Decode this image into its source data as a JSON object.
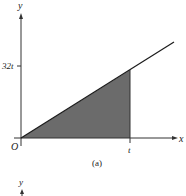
{
  "figure": {
    "panel_a": {
      "caption": "(a)",
      "x_axis_label": "x",
      "y_axis_label": "y",
      "origin_label": "O",
      "y_tick_label": "32t",
      "x_tick_label": "t",
      "line": "y = 32x",
      "shaded_region": "triangle under line from 0 to t",
      "colors": {
        "shade": "#6b6b6b",
        "line": "#1a1a1a",
        "axis": "#333333"
      }
    },
    "panel_b": {
      "y_axis_label": "y"
    }
  }
}
